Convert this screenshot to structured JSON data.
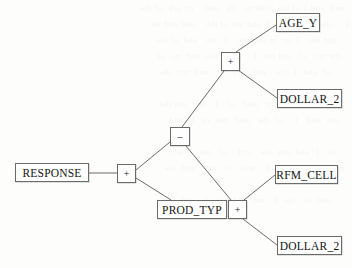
{
  "diagram": {
    "background_color": "#fdfdfc",
    "line_color": "#6b6b6b",
    "text_color": "#141414",
    "nodes": [
      {
        "id": "response",
        "label": "RESPONSE",
        "kind": "variable",
        "name": "node-response",
        "x": 15,
        "y": 163,
        "w": 74,
        "h": 19
      },
      {
        "id": "root-plus",
        "label": "+",
        "kind": "operator",
        "name": "operator-node-plus-root",
        "x": 117,
        "y": 164,
        "w": 19,
        "h": 19
      },
      {
        "id": "minus",
        "label": "–",
        "kind": "operator",
        "name": "operator-node-minus",
        "x": 170,
        "y": 127,
        "w": 20,
        "h": 19
      },
      {
        "id": "upper-plus",
        "label": "+",
        "kind": "operator",
        "name": "operator-node-plus-upper",
        "x": 221,
        "y": 52,
        "w": 19,
        "h": 19
      },
      {
        "id": "age-y",
        "label": "AGE_Y",
        "kind": "variable",
        "name": "node-age-y",
        "x": 276,
        "y": 13,
        "w": 44,
        "h": 19
      },
      {
        "id": "dollar-2-top",
        "label": "DOLLAR_2",
        "kind": "variable",
        "name": "node-dollar-2-upper",
        "x": 277,
        "y": 89,
        "w": 65,
        "h": 19
      },
      {
        "id": "prod-typ",
        "label": "PROD_TYP",
        "kind": "variable",
        "name": "node-prod-typ",
        "x": 157,
        "y": 200,
        "w": 70,
        "h": 19
      },
      {
        "id": "lower-plus",
        "label": "+",
        "kind": "operator",
        "name": "operator-node-plus-lower",
        "x": 228,
        "y": 200,
        "w": 19,
        "h": 19
      },
      {
        "id": "rfm-cell",
        "label": "RFM_CELL",
        "kind": "variable",
        "name": "node-rfm-cell",
        "x": 275,
        "y": 165,
        "w": 63,
        "h": 19
      },
      {
        "id": "dollar-2-bottom",
        "label": "DOLLAR_2",
        "kind": "variable",
        "name": "node-dollar-2-lower",
        "x": 277,
        "y": 236,
        "w": 65,
        "h": 19
      }
    ],
    "edges": [
      {
        "id": "e1",
        "from": "response",
        "to": "root-plus",
        "name": "edge-response-to-plus-root",
        "x1": 89,
        "y1": 173,
        "x2": 117,
        "y2": 173
      },
      {
        "id": "e2",
        "from": "root-plus",
        "to": "minus",
        "name": "edge-plus-root-to-minus",
        "x1": 136,
        "y1": 170,
        "x2": 170,
        "y2": 142
      },
      {
        "id": "e3",
        "from": "root-plus",
        "to": "prod-typ",
        "name": "edge-plus-root-to-prod-typ",
        "x1": 136,
        "y1": 178,
        "x2": 171,
        "y2": 200
      },
      {
        "id": "e4",
        "from": "minus",
        "to": "upper-plus",
        "name": "edge-minus-to-plus-upper",
        "x1": 182,
        "y1": 127,
        "x2": 224,
        "y2": 71
      },
      {
        "id": "e5",
        "from": "minus",
        "to": "lower-plus",
        "name": "edge-minus-to-plus-lower",
        "x1": 186,
        "y1": 146,
        "x2": 231,
        "y2": 200
      },
      {
        "id": "e6",
        "from": "upper-plus",
        "to": "age-y",
        "name": "edge-plus-upper-to-age-y",
        "x1": 236,
        "y1": 52,
        "x2": 276,
        "y2": 25
      },
      {
        "id": "e7",
        "from": "upper-plus",
        "to": "dollar-2-top",
        "name": "edge-plus-upper-to-dollar-2-upper",
        "x1": 238,
        "y1": 70,
        "x2": 277,
        "y2": 98
      },
      {
        "id": "e8",
        "from": "lower-plus",
        "to": "rfm-cell",
        "name": "edge-plus-lower-to-rfm-cell",
        "x1": 244,
        "y1": 200,
        "x2": 275,
        "y2": 175
      },
      {
        "id": "e9",
        "from": "lower-plus",
        "to": "dollar-2-bottom",
        "name": "edge-plus-lower-to-dollar-2-lower",
        "x1": 243,
        "y1": 219,
        "x2": 277,
        "y2": 245
      }
    ]
  },
  "ghost_text": {
    "lines": "   and  and 1 of the 1000 no  lik   and    no orb  of the\n 1     the  and  not    1  and not of the    and and no\n      not the   1  of  in the  not   1   no   and  of the\n    the not   of  and not  1    and    the  and  no  of\n        of  and  1  the   and   not   of   and  not  the\n\n   and   of  1  the   not   and   of   1   and  not the\n     not  and   1    of  the   and   not  of  1   and\n\n      of   1  and  not  the   and    of   not  1  and\n   not  of   and   the  1    and   of   not   and  the\n\n        and  of   the  1   not  and   of   1   and  not"
  }
}
